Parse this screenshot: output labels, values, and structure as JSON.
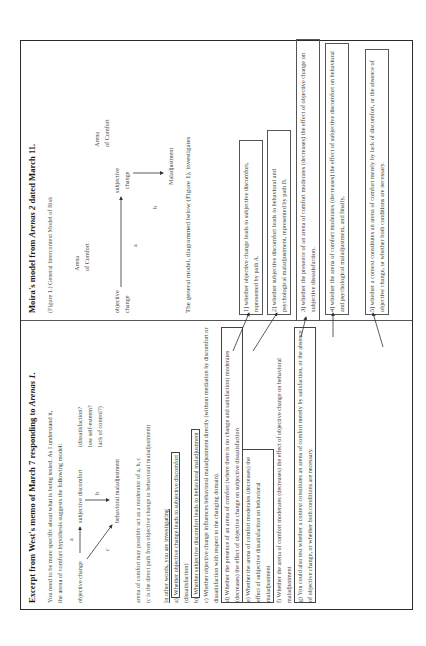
{
  "left": {
    "heading_prefix": "Excerpt from West's memo of March 7 responding to ",
    "heading_italic": "Arenas 1",
    "heading_suffix": ".",
    "intro_line1": "You need to be more specific about what is being tested.  As I understand it,",
    "intro_line2": "the arena of comfort hypothesis suggests the following model:",
    "diagram": {
      "objective_change": "objective change",
      "subjective_discomfort": "subjective discomfort",
      "behavioral_maladjustment": "behavioral maladjustment",
      "label_a": "a",
      "label_b": "b",
      "label_c": "c",
      "note1": "(dissatisfaction?",
      "note2": "low self-esteem?",
      "note3": "lack of control?)"
    },
    "moderator_line": "arena of comfort may possibly act as a moderator of a, b, c",
    "direct_path_line": "(c is the direct path from objective change to behavioral maladjustment)",
    "investigating": "In other words, you are investigating",
    "items": [
      {
        "prefix": "a)",
        "boxed": "Whether objective change leads to subjective discomfort",
        "rest": "(dissatisfaction)"
      },
      {
        "prefix": "b)",
        "boxed": "Whether subjective discomfort leads to behavioral maladjustment",
        "rest": ""
      },
      {
        "prefix": "c)",
        "boxed": "",
        "rest": "Whether objective change influences behavioral maladjustment directly (without mediation by discomfort or dissatisfaction with respect to the changing domain)."
      },
      {
        "prefix": "d)",
        "boxed": "Whether the presence of an arena of comfort (where there is no change and satisfaction) moderates (decreases) the effect of objective change on subjective dissatisfaction",
        "rest": ""
      },
      {
        "prefix": "e)",
        "boxed": "Whether the arena of comfort moderates (decreases) the effect of subjective dissatisfaction on behavioral maladjustment",
        "rest": ""
      },
      {
        "prefix": "f)",
        "boxed": "",
        "rest": "Whether the arena of comfort moderates (decreases) the effect of objective change on behavioral maladjustment"
      },
      {
        "prefix": "g)",
        "boxed": "You could also test whether a context constitutes an arena of comfort merely by satisfaction, or the absence of objective change, or whether both conditions are necessary.",
        "rest": ""
      }
    ]
  },
  "right": {
    "heading_prefix": "Moira's model from ",
    "heading_italic": "Arenas 2",
    "heading_suffix": "  dated March 11.",
    "figure_caption": "(Figure 1.) General Intercontext Model of Risk",
    "diagram": {
      "arena1_line1": "Arena",
      "arena1_line2": "of Comfort",
      "objective_line1": "objective",
      "objective_line2": "change",
      "subjective_line1": "subjective",
      "subjective_line2": "change",
      "label_a": "a",
      "label_b": "b",
      "arena2_line1": "Arena",
      "arena2_line2": "of Comfort",
      "maladjustment": "Maladjustment"
    },
    "general_model": "The general model, diagrammed below (Figure 1), investigates",
    "boxes": [
      {
        "text": "1) whether objective change leads to subjective discomfort, represented by path A."
      },
      {
        "text": "2) whether subjective discomfort leads to behavioral and psychological maladjustment, represented by path B."
      },
      {
        "text": "3) whether the presence of an arena of comfort moderates (decreases) the effect of objective change on subjective dissatisfaction."
      },
      {
        "text": "4) whether the arena of comfort moderates (decreases) the effect of subjective discomfort on behavioral and psychological maladjustment, and finally,"
      },
      {
        "text": "5) whether a context constitutes an arena of comfort merely by lack of discomfort, or the absence of objective change, or whether both conditions are necessary."
      }
    ]
  },
  "colors": {
    "text": "#444444",
    "heading": "#1a1a1a",
    "border": "#2a2a2a",
    "background": "#ffffff"
  }
}
